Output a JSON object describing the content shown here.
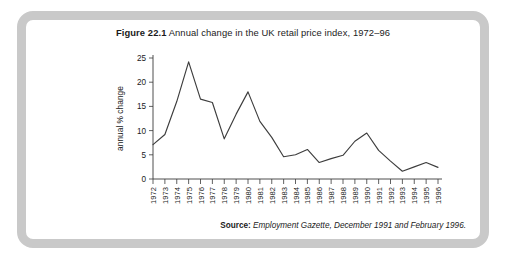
{
  "figure": {
    "label": "Figure 22.1",
    "title": "Annual change in the UK retail price index, 1972–96"
  },
  "source": {
    "label": "Source:",
    "text": "Employment Gazette, December 1991 and February 1996."
  },
  "colors": {
    "frame": "#c9c9c9",
    "line": "#3d3d3d",
    "axis": "#3a3a3a",
    "background": "#ffffff",
    "text": "#1b1b1b"
  },
  "chart_data": {
    "type": "line",
    "title": "Annual change in the UK retail price index, 1972–96",
    "xlabel": "",
    "ylabel": "annual % change",
    "ylim": [
      0,
      25
    ],
    "yticks": [
      0,
      5,
      10,
      15,
      20,
      25
    ],
    "grid": false,
    "legend": null,
    "categories": [
      "1972",
      "1973",
      "1974",
      "1975",
      "1976",
      "1977",
      "1978",
      "1979",
      "1980",
      "1981",
      "1982",
      "1983",
      "1984",
      "1985",
      "1986",
      "1987",
      "1988",
      "1989",
      "1990",
      "1991",
      "1992",
      "1993",
      "1994",
      "1995",
      "1996"
    ],
    "values": [
      7.1,
      9.2,
      16.0,
      24.2,
      16.5,
      15.8,
      8.3,
      13.4,
      18.0,
      11.9,
      8.6,
      4.6,
      5.0,
      6.1,
      3.4,
      4.2,
      4.9,
      7.8,
      9.5,
      5.9,
      3.7,
      1.6,
      2.5,
      3.4,
      2.4
    ],
    "series": [
      {
        "name": "UK retail price index, annual % change",
        "values": [
          7.1,
          9.2,
          16.0,
          24.2,
          16.5,
          15.8,
          8.3,
          13.4,
          18.0,
          11.9,
          8.6,
          4.6,
          5.0,
          6.1,
          3.4,
          4.2,
          4.9,
          7.8,
          9.5,
          5.9,
          3.7,
          1.6,
          2.5,
          3.4,
          2.4
        ]
      }
    ]
  }
}
